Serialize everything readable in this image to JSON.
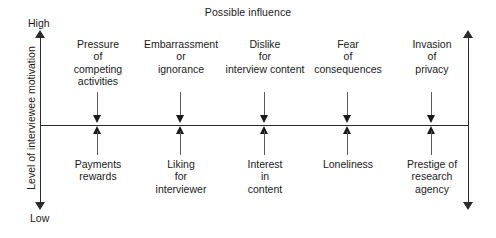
{
  "diagram": {
    "title": "Possible influence",
    "y_axis": {
      "caption": "Level of interviewee motivation",
      "high_label": "High",
      "low_label": "Low"
    },
    "factors": [
      {
        "x": 98,
        "negative": "Pressure\nof\ncompeting\nactivities",
        "positive": "Payments\nrewards"
      },
      {
        "x": 181,
        "negative": "Embarrassment\nor\nignorance",
        "positive": "Liking\nfor\ninterviewer"
      },
      {
        "x": 265,
        "negative": "Dislike\nfor\ninterview content",
        "positive": "Interest\nin\ncontent"
      },
      {
        "x": 348,
        "negative": "Fear\nof\nconsequences",
        "positive": "Loneliness"
      },
      {
        "x": 432,
        "negative": "Invasion\nof\nprivacy",
        "positive": "Prestige of\nresearch\nagency"
      }
    ]
  },
  "colors": {
    "ink": "#1a1a1a",
    "rule": "#2b2b2b",
    "stem": "#5a5a5a",
    "background": "#ffffff"
  }
}
